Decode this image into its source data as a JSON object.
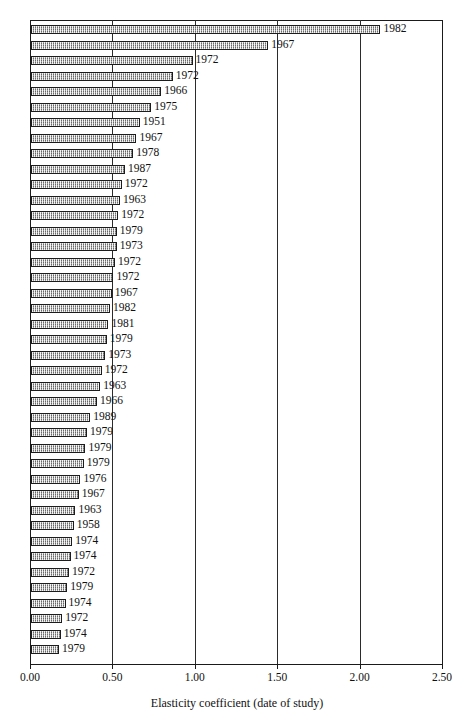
{
  "chart_data": {
    "type": "bar",
    "orientation": "horizontal",
    "title": "",
    "xlabel": "Elasticity coefficient (date of study)",
    "ylabel": "",
    "xlim": [
      0.0,
      2.5
    ],
    "xticks": [
      "0.00",
      "0.50",
      "1.00",
      "1.50",
      "2.00",
      "2.50"
    ],
    "xtick_values": [
      0.0,
      0.5,
      1.0,
      1.5,
      2.0,
      2.5
    ],
    "grid": "vertical gridlines at each major tick",
    "legend": "none",
    "bar_color": "#9a9a9a",
    "bar_border_color": "#1c1c1c",
    "axis_color": "#1a1a1a",
    "note": "Each bar is annotated at its tip with the date of study; bars sorted descending by elasticity coefficient.",
    "categories": [
      "1982",
      "1967",
      "1972",
      "1972",
      "1966",
      "1975",
      "1951",
      "1967",
      "1978",
      "1987",
      "1972",
      "1963",
      "1972",
      "1979",
      "1973",
      "1972",
      "1972",
      "1967",
      "1982",
      "1981",
      "1979",
      "1973",
      "1972",
      "1963",
      "1966",
      "1989",
      "1979",
      "1979",
      "1979",
      "1976",
      "1967",
      "1963",
      "1958",
      "1974",
      "1974",
      "1972",
      "1979",
      "1974",
      "1972",
      "1974",
      "1979"
    ],
    "labels": [
      "1982",
      "1967",
      "1972",
      "1972",
      "1966",
      "1975",
      "1951",
      "1967",
      "1978",
      "1987",
      "1972",
      "1963",
      "1972",
      "1979",
      "1973",
      "1972",
      "1972",
      "1967",
      "1982",
      "1981",
      "1979",
      "1973",
      "1972",
      "1963",
      "1966",
      "1989",
      "1979",
      "1979",
      "1979",
      "1976",
      "1967",
      "1963",
      "1958",
      "1974",
      "1974",
      "1972",
      "1979",
      "1974",
      "1972",
      "1974",
      "1979"
    ],
    "values": [
      2.12,
      1.44,
      0.98,
      0.86,
      0.79,
      0.73,
      0.66,
      0.64,
      0.62,
      0.57,
      0.55,
      0.54,
      0.53,
      0.52,
      0.52,
      0.51,
      0.5,
      0.49,
      0.48,
      0.47,
      0.46,
      0.45,
      0.43,
      0.42,
      0.4,
      0.36,
      0.34,
      0.33,
      0.32,
      0.3,
      0.29,
      0.27,
      0.26,
      0.25,
      0.24,
      0.23,
      0.22,
      0.21,
      0.19,
      0.18,
      0.17
    ]
  }
}
